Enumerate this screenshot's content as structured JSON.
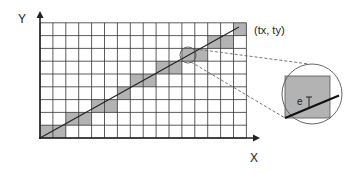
{
  "labels": {
    "y_axis": "Y",
    "x_axis": "X",
    "endpoint": "(tx, ty)",
    "angle": "e"
  },
  "grid": {
    "origin_x": 40,
    "origin_y": 138,
    "cols": 16,
    "rows": 9,
    "cell_w": 12.9,
    "cell_h": 12.8,
    "shaded_cells": [
      [
        0,
        0
      ],
      [
        1,
        0
      ],
      [
        2,
        1
      ],
      [
        3,
        1
      ],
      [
        4,
        2
      ],
      [
        5,
        2
      ],
      [
        6,
        3
      ],
      [
        7,
        4
      ],
      [
        8,
        4
      ],
      [
        9,
        5
      ],
      [
        10,
        5
      ],
      [
        11,
        6
      ],
      [
        12,
        6
      ],
      [
        13,
        7
      ],
      [
        14,
        7
      ],
      [
        15,
        8
      ]
    ]
  },
  "colors": {
    "grid_line": "#333333",
    "shade": "#b3b3b3",
    "line": "#222222",
    "dash": "#666666",
    "background": "#ffffff"
  },
  "line": {
    "x1": 40,
    "y1": 138,
    "x2": 239,
    "y2": 27
  },
  "magnifier": {
    "small_circle": {
      "cx": 188,
      "cy": 55,
      "r": 8
    },
    "inset_circle": {
      "cx": 312,
      "cy": 94,
      "r": 30
    },
    "inset_square": {
      "x": 285,
      "y": 76,
      "w": 45,
      "h": 42
    }
  }
}
